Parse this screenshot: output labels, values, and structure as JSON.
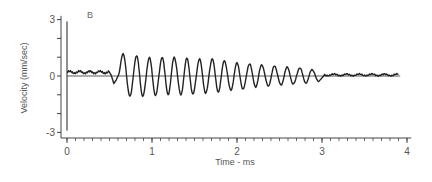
{
  "chart_data": {
    "type": "line",
    "panel_label": "B",
    "title": "",
    "xlabel": "Time - ms",
    "ylabel": "Velocity (mm/sec)",
    "xlim": [
      0,
      4
    ],
    "ylim": [
      -3,
      3
    ],
    "x_ticks": [
      0,
      1,
      2,
      3,
      4
    ],
    "x_tick_labels": [
      "0",
      "1",
      "2",
      "3",
      "4"
    ],
    "x_minor_tick_step": 0.1,
    "y_ticks": [
      -3,
      -2,
      -1,
      0,
      1,
      2,
      3
    ],
    "y_tick_labels": [
      "-3",
      "",
      "",
      "0",
      "",
      "",
      "3"
    ],
    "grid": false,
    "legend": null,
    "zero_line": true,
    "stimulus_marker_x": 0,
    "series": [
      {
        "name": "velocity",
        "description": "Baseline ~+0.2 from 0 to 0.5 ms, small dip to ~-0.4 near 0.55 ms, then damped oscillation (~6.8 kHz, period ~0.147 ms) with peak amplitude ~1.2 decaying to ~0.4 by 3.0 ms, followed by low-level noise ~+0.1 to ~3.9 ms",
        "segments": {
          "baseline": {
            "x": [
              0.0,
              0.5
            ],
            "y": 0.2
          },
          "dip": {
            "x": 0.55,
            "y": -0.4
          },
          "oscillation": {
            "x_start": 0.6,
            "x_end": 3.0,
            "period_ms": 0.147,
            "amp_start": 1.2,
            "amp_end": 0.35
          },
          "tail": {
            "x": [
              3.0,
              3.9
            ],
            "y": 0.1
          }
        },
        "peaks": [
          {
            "x": 0.66,
            "y": 1.2
          },
          {
            "x": 0.82,
            "y": 1.1
          },
          {
            "x": 0.97,
            "y": 1.0
          },
          {
            "x": 1.12,
            "y": 1.0
          },
          {
            "x": 1.26,
            "y": 1.0
          },
          {
            "x": 1.41,
            "y": 0.95
          },
          {
            "x": 1.56,
            "y": 0.9
          },
          {
            "x": 1.71,
            "y": 0.9
          },
          {
            "x": 1.85,
            "y": 0.8
          },
          {
            "x": 2.0,
            "y": 0.7
          },
          {
            "x": 2.15,
            "y": 0.65
          },
          {
            "x": 2.29,
            "y": 0.6
          },
          {
            "x": 2.44,
            "y": 0.55
          },
          {
            "x": 2.59,
            "y": 0.5
          },
          {
            "x": 2.74,
            "y": 0.45
          },
          {
            "x": 2.88,
            "y": 0.35
          }
        ],
        "troughs": [
          {
            "x": 0.74,
            "y": -1.1
          },
          {
            "x": 0.89,
            "y": -1.1
          },
          {
            "x": 1.04,
            "y": -1.05
          },
          {
            "x": 1.19,
            "y": -1.0
          },
          {
            "x": 1.34,
            "y": -1.0
          },
          {
            "x": 1.48,
            "y": -0.95
          },
          {
            "x": 1.63,
            "y": -0.9
          },
          {
            "x": 1.78,
            "y": -0.85
          },
          {
            "x": 1.93,
            "y": -0.75
          },
          {
            "x": 2.07,
            "y": -0.7
          },
          {
            "x": 2.22,
            "y": -0.6
          },
          {
            "x": 2.37,
            "y": -0.55
          },
          {
            "x": 2.52,
            "y": -0.5
          },
          {
            "x": 2.66,
            "y": -0.45
          },
          {
            "x": 2.81,
            "y": -0.4
          },
          {
            "x": 2.96,
            "y": -0.3
          }
        ]
      }
    ],
    "colors": {
      "trace": "#222222",
      "axes": "#444444",
      "text": "#555555"
    }
  }
}
